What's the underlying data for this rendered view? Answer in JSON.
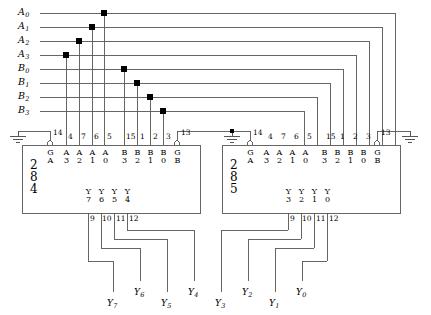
{
  "diagram": {
    "line_color": "#555555",
    "text_color": "#000000",
    "dot_color": "#000000"
  },
  "inputs": [
    {
      "name": "A0",
      "base": "A",
      "sub": "0",
      "y": 13,
      "tap_x": 104
    },
    {
      "name": "A1",
      "base": "A",
      "sub": "1",
      "y": 27,
      "tap_x": 92
    },
    {
      "name": "A2",
      "base": "A",
      "sub": "2",
      "y": 41,
      "tap_x": 79
    },
    {
      "name": "A3",
      "base": "A",
      "sub": "3",
      "y": 55,
      "tap_x": 66
    },
    {
      "name": "B0",
      "base": "B",
      "sub": "0",
      "y": 69,
      "tap_x": 124
    },
    {
      "name": "B1",
      "base": "B",
      "sub": "1",
      "y": 83,
      "tap_x": 137
    },
    {
      "name": "B2",
      "base": "B",
      "sub": "2",
      "y": 97,
      "tap_x": 150
    },
    {
      "name": "B3",
      "base": "B",
      "sub": "3",
      "y": 111,
      "tap_x": 163
    }
  ],
  "ics": [
    {
      "id": "ic-284",
      "name_lines": [
        "2",
        "8",
        "4"
      ],
      "box": {
        "x": 22,
        "y": 145,
        "w": 178,
        "h": 68
      },
      "enable_left": {
        "pin": "14",
        "label_top": "G",
        "label_bot": "A",
        "bubble": true
      },
      "enable_right": {
        "pin": "13",
        "label_top": "G",
        "label_bot": "B",
        "bubble": true
      },
      "top_pins": [
        {
          "pin": "4",
          "label_top": "A",
          "label_bot": "3"
        },
        {
          "pin": "7",
          "label_top": "A",
          "label_bot": "2"
        },
        {
          "pin": "6",
          "label_top": "A",
          "label_bot": "1"
        },
        {
          "pin": "5",
          "label_top": "A",
          "label_bot": "0"
        },
        {
          "pin": "15",
          "label_top": "B",
          "label_bot": "3"
        },
        {
          "pin": "1",
          "label_top": "B",
          "label_bot": "2"
        },
        {
          "pin": "2",
          "label_top": "B",
          "label_bot": "1"
        },
        {
          "pin": "3",
          "label_top": "B",
          "label_bot": "0"
        }
      ],
      "out_pins": [
        {
          "pin": "9",
          "label_top": "Y",
          "label_bot": "7"
        },
        {
          "pin": "10",
          "label_top": "Y",
          "label_bot": "6"
        },
        {
          "pin": "11",
          "label_top": "Y",
          "label_bot": "5"
        },
        {
          "pin": "12",
          "label_top": "Y",
          "label_bot": "4"
        }
      ]
    },
    {
      "id": "ic-285",
      "name_lines": [
        "2",
        "8",
        "5"
      ],
      "box": {
        "x": 222,
        "y": 145,
        "w": 178,
        "h": 68
      },
      "enable_left": {
        "pin": "14",
        "label_top": "G",
        "label_bot": "A",
        "bubble": true
      },
      "enable_right": {
        "pin": "13",
        "label_top": "G",
        "label_bot": "B",
        "bubble": true
      },
      "top_pins": [
        {
          "pin": "4",
          "label_top": "A",
          "label_bot": "3"
        },
        {
          "pin": "7",
          "label_top": "A",
          "label_bot": "2"
        },
        {
          "pin": "6",
          "label_top": "A",
          "label_bot": "1"
        },
        {
          "pin": "5",
          "label_top": "A",
          "label_bot": "0"
        },
        {
          "pin": "15",
          "label_top": "B",
          "label_bot": "3"
        },
        {
          "pin": "1",
          "label_top": "B",
          "label_bot": "2"
        },
        {
          "pin": "2",
          "label_top": "B",
          "label_bot": "1"
        },
        {
          "pin": "3",
          "label_top": "B",
          "label_bot": "0"
        }
      ],
      "out_pins": [
        {
          "pin": "9",
          "label_top": "Y",
          "label_bot": "3"
        },
        {
          "pin": "10",
          "label_top": "Y",
          "label_bot": "2"
        },
        {
          "pin": "11",
          "label_top": "Y",
          "label_bot": "1"
        },
        {
          "pin": "12",
          "label_top": "Y",
          "label_bot": "0"
        }
      ]
    }
  ],
  "outputs": [
    {
      "name": "Y7",
      "base": "Y",
      "sub": "7",
      "x": 107,
      "y": 299
    },
    {
      "name": "Y6",
      "base": "Y",
      "sub": "6",
      "x": 134,
      "y": 288
    },
    {
      "name": "Y5",
      "base": "Y",
      "sub": "5",
      "x": 161,
      "y": 299
    },
    {
      "name": "Y4",
      "base": "Y",
      "sub": "4",
      "x": 188,
      "y": 288
    },
    {
      "name": "Y3",
      "base": "Y",
      "sub": "3",
      "x": 215,
      "y": 299
    },
    {
      "name": "Y2",
      "base": "Y",
      "sub": "2",
      "x": 242,
      "y": 288
    },
    {
      "name": "Y1",
      "base": "Y",
      "sub": "1",
      "x": 269,
      "y": 299
    },
    {
      "name": "Y0",
      "base": "Y",
      "sub": "0",
      "x": 296,
      "y": 288
    }
  ],
  "grounds": [
    {
      "name": "ground-left-284",
      "x": 18,
      "y": 131
    },
    {
      "name": "ground-left-285",
      "x": 232,
      "y": 131
    },
    {
      "name": "ground-right-285",
      "x": 410,
      "y": 131
    }
  ]
}
